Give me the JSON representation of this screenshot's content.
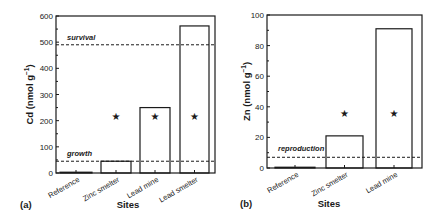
{
  "chart_data": [
    {
      "type": "bar",
      "panel": "(a)",
      "title": "",
      "xlabel": "Sites",
      "ylabel": "Cd (nmol g⁻¹)",
      "ylabel_main": "Cd (nmol g",
      "ylabel_sup": "−1",
      "ylabel_close": ")",
      "ylim": [
        0,
        600
      ],
      "yticks": [
        0,
        100,
        200,
        300,
        400,
        500,
        600
      ],
      "categories": [
        "Reference",
        "Zinc smelter",
        "Lead mine",
        "Lead smelter"
      ],
      "values": [
        3,
        45,
        250,
        562
      ],
      "significant": [
        false,
        true,
        true,
        true
      ],
      "significance_marker": "*",
      "thresholds": [
        {
          "label": "survival",
          "value": 490
        },
        {
          "label": "growth",
          "value": 45
        }
      ],
      "grid": false
    },
    {
      "type": "bar",
      "panel": "(b)",
      "title": "",
      "xlabel": "Sites",
      "ylabel": "Zn (nmol g⁻¹)",
      "ylabel_main": "Zn (nmol g",
      "ylabel_sup": "−1",
      "ylabel_close": ")",
      "ylim": [
        0,
        100
      ],
      "yticks": [
        0,
        20,
        40,
        60,
        80,
        100
      ],
      "categories": [
        "Reference",
        "Zinc smelter",
        "Lead mine"
      ],
      "values": [
        0.5,
        21,
        91
      ],
      "significant": [
        false,
        true,
        true
      ],
      "significance_marker": "*",
      "thresholds": [
        {
          "label": "reproduction",
          "value": 7
        }
      ],
      "grid": false
    }
  ],
  "colors": {
    "ink": "#1a1a1a",
    "bar_fill": "#ffffff",
    "background": "#ffffff"
  }
}
